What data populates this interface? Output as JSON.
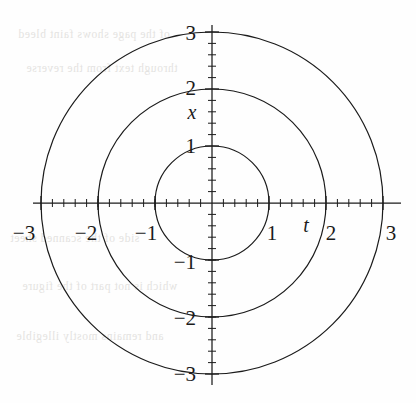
{
  "figure": {
    "kind": "polar-concentric-circles-plot",
    "background_color": "#fefefe",
    "ink_color": "#1b1b1b"
  },
  "chart_data": {
    "type": "line",
    "title": "",
    "xlabel": "t",
    "ylabel": "x",
    "xlim": [
      -3.3,
      3.3
    ],
    "ylim": [
      -3.3,
      3.3
    ],
    "grid": false,
    "legend": "none",
    "axes_style": "centered-cross-with-minor-ticks",
    "minor_tick_step": 0.2,
    "major_tick_step": 1,
    "x_ticks": [
      -3,
      -2,
      -1,
      1,
      2,
      3
    ],
    "y_ticks": [
      -3,
      -2,
      -1,
      1,
      2,
      3
    ],
    "x_tick_labels": [
      "-3",
      "-2",
      "-1",
      "1",
      "2",
      "3"
    ],
    "y_tick_labels": [
      "-3",
      "-2",
      "-1",
      "1",
      "2",
      "3"
    ],
    "series": [
      {
        "name": "circle r=1",
        "shape": "circle",
        "center": [
          0,
          0
        ],
        "radius": 1
      },
      {
        "name": "circle r=2",
        "shape": "circle",
        "center": [
          0,
          0
        ],
        "radius": 2
      },
      {
        "name": "circle r=3",
        "shape": "circle",
        "center": [
          0,
          0
        ],
        "radius": 3
      }
    ],
    "annotations": [
      {
        "text": "x",
        "x": -0.32,
        "y": 1.62,
        "style": "italic",
        "role": "vertical-axis-name"
      },
      {
        "text": "t",
        "x": 1.63,
        "y": -0.43,
        "style": "italic",
        "role": "horizontal-axis-name"
      }
    ]
  },
  "labels": {
    "x_neg3": "−3",
    "x_neg2": "−2",
    "x_neg1": "−1",
    "x_pos1": "1",
    "x_pos2": "2",
    "x_pos3": "3",
    "y_pos3": "3",
    "y_pos2": "2",
    "y_pos1": "1",
    "y_neg1": "−1",
    "y_neg2": "−2",
    "y_neg3": "−3",
    "axis_name_vertical": "x",
    "axis_name_horizontal": "t"
  },
  "ghost_text": {
    "lines": [
      "of the page shows faint bleed",
      "through text from the reverse",
      "side of the scanned sheet",
      "which is not part of the figure",
      "and remains mostly illegible"
    ]
  }
}
